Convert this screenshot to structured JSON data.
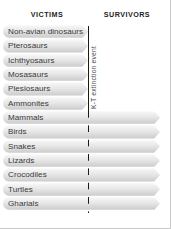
{
  "figure": {
    "top_clipped_text": "· ·",
    "columns": {
      "victims_label": "VICTIMS",
      "survivors_label": "SURVIVORS"
    },
    "divider": {
      "label": "K-T extinction event",
      "line_color": "#1a1a1a",
      "solid_through": "victims",
      "dashed_through": "survivors"
    },
    "bar_colors": {
      "highlight": "#fbfbfb",
      "midtone": "#e6e6e6",
      "shadow": "#cfcfcf"
    },
    "text_color": "#3a3a3a",
    "heading_color": "#231f20",
    "rows": [
      {
        "label": "Non-avian dinosaurs",
        "group": "victim"
      },
      {
        "label": "Pterosaurs",
        "group": "victim"
      },
      {
        "label": "Ichthyosaurs",
        "group": "victim"
      },
      {
        "label": "Mosasaurs",
        "group": "victim"
      },
      {
        "label": "Plesiosaurs",
        "group": "victim"
      },
      {
        "label": "Ammonites",
        "group": "victim"
      },
      {
        "label": "Mammals",
        "group": "survivor"
      },
      {
        "label": "Birds",
        "group": "survivor"
      },
      {
        "label": "Snakes",
        "group": "survivor"
      },
      {
        "label": "Lizards",
        "group": "survivor"
      },
      {
        "label": "Crocodiles",
        "group": "survivor"
      },
      {
        "label": "Turtles",
        "group": "survivor"
      },
      {
        "label": "Gharials",
        "group": "survivor"
      }
    ]
  },
  "chart_data": {
    "type": "bar",
    "title": "",
    "xlabel": "",
    "ylabel": "",
    "orientation": "horizontal",
    "annotations": [
      "K-T extinction event"
    ],
    "legend": [
      "VICTIMS",
      "SURVIVORS"
    ],
    "categories": [
      "Non-avian dinosaurs",
      "Pterosaurs",
      "Ichthyosaurs",
      "Mosasaurs",
      "Plesiosaurs",
      "Ammonites",
      "Mammals",
      "Birds",
      "Snakes",
      "Lizards",
      "Crocodiles",
      "Turtles",
      "Gharials"
    ],
    "values": [
      1,
      1,
      1,
      1,
      1,
      1,
      2,
      2,
      2,
      2,
      2,
      2,
      2
    ],
    "value_meaning": "1 = bar terminates at the K-T extinction boundary (victim); 2 = bar continues past the boundary to the present (survivor)",
    "grid": false,
    "legend_position": "top"
  }
}
